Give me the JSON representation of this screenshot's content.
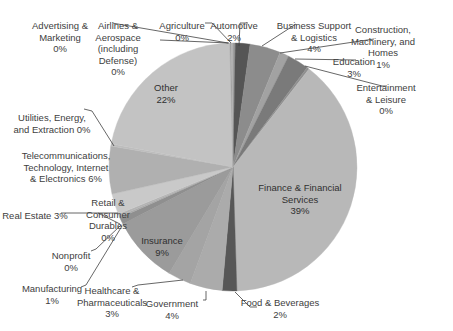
{
  "chart_data": {
    "type": "pie",
    "title": "",
    "center": [
      233,
      167
    ],
    "radius": 124,
    "start_angle_deg": 0,
    "direction": "clockwise",
    "slices": [
      {
        "label": "Agriculture",
        "pct_label": "0%",
        "value": 0.3,
        "color": "#9a9a9a"
      },
      {
        "label": "Automotive",
        "pct_label": "2%",
        "value": 1.9,
        "color": "#555555"
      },
      {
        "label": "Business Support & Logistics",
        "pct_label": "4%",
        "value": 4.0,
        "color": "#8c8c8c"
      },
      {
        "label": "Construction, Machinery, and Homes",
        "pct_label": "1%",
        "value": 1.2,
        "color": "#a2a2a2"
      },
      {
        "label": "Education",
        "pct_label": "3%",
        "value": 2.8,
        "color": "#7a7a7a"
      },
      {
        "label": "Entertainment & Leisure",
        "pct_label": "0%",
        "value": 0.3,
        "color": "#909090"
      },
      {
        "label": "Finance & Financial Services",
        "pct_label": "39%",
        "value": 39.0,
        "color": "#b8b8b8"
      },
      {
        "label": "Food & Beverages",
        "pct_label": "2%",
        "value": 1.9,
        "color": "#575757"
      },
      {
        "label": "Government",
        "pct_label": "4%",
        "value": 4.2,
        "color": "#ababab"
      },
      {
        "label": "Healthcare & Pharmaceuticals",
        "pct_label": "3%",
        "value": 3.0,
        "color": "#a4a4a4"
      },
      {
        "label": "Insurance",
        "pct_label": "9%",
        "value": 8.8,
        "color": "#9b9b9b"
      },
      {
        "label": "Manufacturing",
        "pct_label": "1%",
        "value": 0.9,
        "color": "#8f8f8f"
      },
      {
        "label": "Nonprofit",
        "pct_label": "0%",
        "value": 0.2,
        "color": "#a8a8a8"
      },
      {
        "label": "Retail & Consumer Durables",
        "pct_label": "0%",
        "value": 0.3,
        "color": "#b3b3b3"
      },
      {
        "label": "Real Estate",
        "pct_label": "3%",
        "value": 2.7,
        "color": "#c9c9c9"
      },
      {
        "label": "Telecommunications, Technology, Internet & Electronics",
        "pct_label": "6%",
        "value": 6.2,
        "color": "#b0b0b0"
      },
      {
        "label": "Utilities, Energy, and Extraction",
        "pct_label": "0%",
        "value": 0.3,
        "color": "#bdbdbd"
      },
      {
        "label": "Other",
        "pct_label": "22%",
        "value": 21.6,
        "color": "#c3c3c3"
      },
      {
        "label": "Advertising & Marketing",
        "pct_label": "0%",
        "value": 0.2,
        "color": "#a0a0a0"
      },
      {
        "label": "Airlines & Aerospace (including Defense)",
        "pct_label": "0%",
        "value": 0.2,
        "color": "#b0b0b0"
      }
    ],
    "labels": [
      {
        "id": "advertising",
        "text": "Advertising &\nMarketing\n0%",
        "x": 60,
        "y": 20,
        "inside": false
      },
      {
        "id": "airlines",
        "text": "Airlines &\nAerospace\n(including\nDefense)\n0%",
        "x": 118,
        "y": 20,
        "inside": false
      },
      {
        "id": "agriculture",
        "text": "Agriculture\n0%",
        "x": 182,
        "y": 20,
        "inside": false
      },
      {
        "id": "automotive",
        "text": "Automotive\n2%",
        "x": 234,
        "y": 20,
        "inside": false
      },
      {
        "id": "business",
        "text": "Business Support\n& Logistics\n4%",
        "x": 314,
        "y": 20,
        "inside": false
      },
      {
        "id": "construction",
        "text": "Construction,\nMachinery, and\nHomes\n1%",
        "x": 383,
        "y": 24,
        "inside": false
      },
      {
        "id": "education",
        "text": "Education\n3%",
        "x": 354,
        "y": 56,
        "inside": false
      },
      {
        "id": "entertainment",
        "text": "Entertainment\n& Leisure\n0%",
        "x": 386,
        "y": 82,
        "inside": false
      },
      {
        "id": "finance",
        "text": "Finance & Financial\nServices\n39%",
        "x": 300,
        "y": 182,
        "inside": true
      },
      {
        "id": "food",
        "text": "Food & Beverages\n2%",
        "x": 280,
        "y": 297,
        "inside": false
      },
      {
        "id": "government",
        "text": "Government\n4%",
        "x": 172,
        "y": 298,
        "inside": false
      },
      {
        "id": "healthcare",
        "text": "Healthcare &\nPharmaceuticals\n3%",
        "x": 112,
        "y": 285,
        "inside": false
      },
      {
        "id": "manufacturing",
        "text": "Manufacturing\n1%",
        "x": 52,
        "y": 283,
        "inside": false
      },
      {
        "id": "nonprofit",
        "text": "Nonprofit\n0%",
        "x": 71,
        "y": 250,
        "inside": false
      },
      {
        "id": "retail",
        "text": "Retail &\nConsumer\nDurables\n0%",
        "x": 108,
        "y": 197,
        "inside": false
      },
      {
        "id": "realestate",
        "text": "Real Estate 3%",
        "x": 35,
        "y": 210,
        "inside": false
      },
      {
        "id": "insurance",
        "text": "Insurance\n9%",
        "x": 162,
        "y": 235,
        "inside": true
      },
      {
        "id": "telecom",
        "text": "Telecommunications,\nTechnology, Internet\n& Electronics 6%",
        "x": 66,
        "y": 150,
        "inside": false
      },
      {
        "id": "utilities",
        "text": "Utilities, Energy,\nand Extraction 0%",
        "x": 52,
        "y": 112,
        "inside": false
      },
      {
        "id": "other",
        "text": "Other\n22%",
        "x": 166,
        "y": 82,
        "inside": true
      }
    ],
    "leaders": [
      [
        [
          112,
          23
        ],
        [
          228,
          43
        ]
      ],
      [
        [
          160,
          40
        ],
        [
          229,
          43
        ]
      ],
      [
        [
          205,
          23
        ],
        [
          212,
          23
        ],
        [
          231,
          43
        ]
      ],
      [
        [
          248,
          23
        ],
        [
          240,
          23
        ],
        [
          239,
          46
        ]
      ],
      [
        [
          296,
          24
        ],
        [
          262,
          46
        ]
      ],
      [
        [
          374,
          39
        ],
        [
          280,
          53
        ]
      ],
      [
        [
          356,
          60
        ],
        [
          295,
          59
        ]
      ],
      [
        [
          387,
          86
        ],
        [
          382,
          86
        ],
        [
          305,
          66
        ]
      ],
      [
        [
          257,
          307
        ],
        [
          250,
          307
        ],
        [
          235,
          292
        ]
      ],
      [
        [
          203,
          300
        ],
        [
          206,
          300
        ],
        [
          206,
          291
        ]
      ],
      [
        [
          132,
          287
        ],
        [
          138,
          285
        ],
        [
          183,
          280
        ]
      ],
      [
        [
          81,
          287
        ],
        [
          86,
          285
        ],
        [
          122,
          226
        ]
      ],
      [
        [
          91,
          251
        ],
        [
          96,
          249
        ],
        [
          121,
          225
        ]
      ],
      [
        [
          98,
          213
        ],
        [
          120,
          224
        ]
      ],
      [
        [
          61,
          213
        ],
        [
          118,
          213
        ]
      ],
      [
        [
          84,
          109
        ],
        [
          92,
          111
        ],
        [
          114,
          146
        ]
      ]
    ],
    "legend": "none",
    "background": "#ffffff"
  }
}
